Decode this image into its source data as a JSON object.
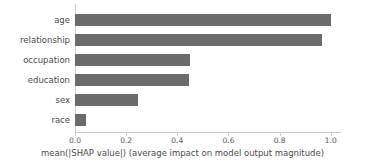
{
  "chart_data": {
    "type": "bar",
    "orientation": "horizontal",
    "title": "",
    "xlabel": "mean(|SHAP value|) (average impact on model output magnitude)",
    "ylabel": "",
    "categories": [
      "age",
      "relationship",
      "occupation",
      "education",
      "sex",
      "race"
    ],
    "values": [
      1.0,
      0.965,
      0.45,
      0.445,
      0.246,
      0.043
    ],
    "xlim": [
      0.0,
      1.04
    ],
    "xticks": [
      0.0,
      0.2,
      0.4,
      0.6,
      0.8,
      1.0
    ],
    "xtick_labels": [
      "0.0",
      "0.2",
      "0.4",
      "0.6",
      "0.8",
      "1.0"
    ],
    "grid": false,
    "legend": null,
    "bar_color": "#6b6b6b",
    "axis_color": "#c9c9c9",
    "background": "#ffffff"
  }
}
